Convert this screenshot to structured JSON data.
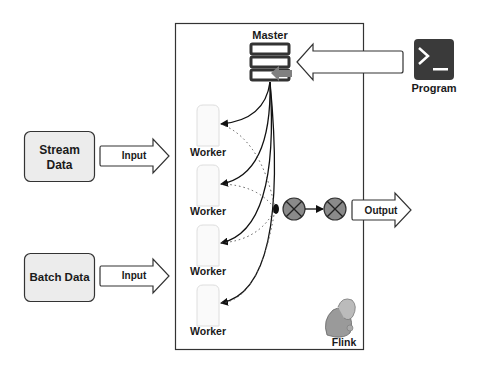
{
  "diagram": {
    "cluster": {
      "label": "Flink",
      "border_color": "#333333"
    },
    "master": {
      "label": "Master",
      "icon": "server-stack-icon"
    },
    "program": {
      "label": "Program",
      "icon": "terminal-icon",
      "icon_bg": "#3a3a3a"
    },
    "sources": [
      {
        "label_line1": "Stream",
        "label_line2": "Data",
        "arrow_label": "Input"
      },
      {
        "label_line1": "Batch Data",
        "label_line2": "",
        "arrow_label": "Input"
      }
    ],
    "workers": [
      {
        "label": "Worker"
      },
      {
        "label": "Worker"
      },
      {
        "label": "Worker"
      },
      {
        "label": "Worker"
      }
    ],
    "operators": [
      {
        "icon": "operator-x-icon",
        "fill": "#8a8a8a"
      },
      {
        "icon": "operator-x-icon",
        "fill": "#8a8a8a"
      }
    ],
    "output": {
      "arrow_label": "Output"
    },
    "colors": {
      "source_box_fill": "#ececec",
      "arrow_fill": "#ffffff",
      "master_arrow": "#808080",
      "line": "#111111",
      "dotted": "#555555"
    }
  }
}
